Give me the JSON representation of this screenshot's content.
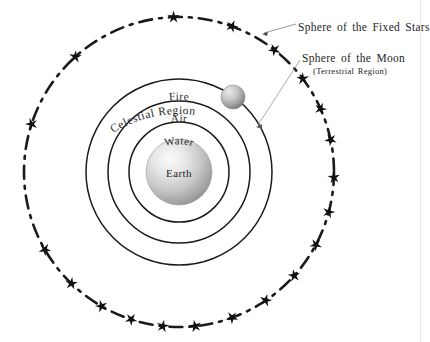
{
  "diagram": {
    "background_color": "#ffffff",
    "ink_color": "#1a1a1a",
    "annotations": {
      "fixed_stars_label": "Sphere of the Fixed Stars",
      "moon_label": "Sphere of the Moon",
      "terrestrial_label": "(Terrestrial Region)"
    },
    "curved_labels": {
      "celestial_region": "Celestial Region"
    },
    "element_labels": [
      {
        "name": "fire",
        "text": "Fire"
      },
      {
        "name": "air",
        "text": "Air"
      },
      {
        "name": "water",
        "text": "Water"
      },
      {
        "name": "earth",
        "text": "Earth"
      }
    ],
    "spheres": [
      {
        "name": "sphere-of-the-fixed-stars",
        "label": "Sphere of the Fixed Stars",
        "style": "dash-dot",
        "radius": 155,
        "center_x": 179,
        "center_y": 172,
        "stroke": "#1a1a1a",
        "stroke_width": 2.6,
        "star_count": 20
      },
      {
        "name": "sphere-of-fire",
        "label": "Fire",
        "style": "solid",
        "radius": 93,
        "center_x": 179,
        "center_y": 172,
        "stroke": "#1a1a1a",
        "stroke_width": 1.5
      },
      {
        "name": "sphere-of-air",
        "label": "Air",
        "style": "solid",
        "radius": 71,
        "center_x": 179,
        "center_y": 172,
        "stroke": "#1a1a1a",
        "stroke_width": 1.5
      },
      {
        "name": "sphere-of-water",
        "label": "Water",
        "style": "solid",
        "radius": 50,
        "center_x": 179,
        "center_y": 172,
        "stroke": "#1a1a1a",
        "stroke_width": 1.5
      },
      {
        "name": "earth-globe",
        "label": "Earth",
        "style": "filled-gradient",
        "radius": 33,
        "center_x": 179,
        "center_y": 172,
        "fill_light": "#f2f2f2",
        "fill_dark": "#8f8f8f"
      }
    ],
    "moon_body": {
      "name": "moon-globe",
      "center_x": 233,
      "center_y": 97,
      "radius": 12,
      "fill_light": "#e0e0e0",
      "fill_dark": "#767676"
    },
    "leader_lines": [
      {
        "name": "leader-fixed-stars",
        "from_x": 296,
        "from_y": 24,
        "to_x": 262,
        "to_y": 34
      },
      {
        "name": "leader-moon",
        "from_x": 300,
        "from_y": 60,
        "to_x": 256,
        "to_y": 127
      }
    ],
    "star_angles_deg": [
      268,
      290,
      308,
      323,
      336,
      348,
      2,
      15,
      28,
      42,
      56,
      70,
      84,
      96,
      108,
      120,
      134,
      150,
      198,
      228
    ]
  }
}
